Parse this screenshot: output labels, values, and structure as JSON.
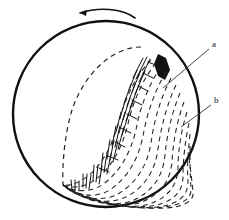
{
  "figure": {
    "kind": "technical-line-drawing",
    "background_color": "#ffffff",
    "ink_color": "#111111",
    "canvas": {
      "width": 229,
      "height": 220
    }
  },
  "sphere": {
    "name": "sphere-outline",
    "center_x": 106,
    "center_y": 114,
    "radius": 93,
    "stroke_width": 2.4,
    "stroke_color": "#111111",
    "fill": "none"
  },
  "rotation_arrow": {
    "name": "rotation-arrow",
    "direction": "counterclockwise-left",
    "stroke_width": 1.6,
    "stroke_color": "#111111",
    "path": "M 135 18 C 122 8, 98 7, 80 13",
    "head": "M 80 13 L 87 10 L 86 16 Z"
  },
  "terminator": {
    "name": "terminator-dashed-curve",
    "stroke_width": 1.2,
    "dash": "5 4",
    "stroke_color": "#222222",
    "path": "M 141 47 C 112 47, 84 74, 72 110 C 65 133, 62 163, 63 185"
  },
  "vertex": {
    "name": "arc-convergence-vertex",
    "x": 63,
    "y": 185
  },
  "arc_family": {
    "name": "nested-dashed-arcs",
    "description": "family of nested dashed arcs fanning from the vertex toward the lower-right limb of the sphere",
    "count": 13,
    "stroke_width": 1.05,
    "dash": "5 4",
    "stroke_color": "#222222",
    "paths": [
      "M 151 60 C 137 74, 126 96, 120 118 C 113 143, 104 163, 88 176 C 79 183, 70 186, 63 185",
      "M 156 63 C 143 79, 133 101, 128 124 C 122 148, 112 167, 95 180 C 85 187, 73 189, 63 185",
      "M 161 67 C 149 84, 140 107, 136 130 C 130 154, 120 172, 102 185 C 91 192, 75 193, 63 185",
      "M 166 72 C 155 90, 147 113, 143 136 C 138 160, 128 177, 110 190 C 97 198, 78 197, 63 185",
      "M 171 78 C 161 97, 154 120, 151 143 C 147 166, 137 182, 118 194 C 103 202, 80 200, 63 185",
      "M 176 85 C 167 104, 161 127, 158 149 C 155 171, 145 187, 126 197 C 110 205, 83 202, 63 185",
      "M 180 93 C 172 112, 167 134, 165 155 C 163 176, 153 191, 134 200 C 116 208, 85 203, 63 185",
      "M 184 102 C 177 121, 173 142, 172 162 C 170 181, 161 194, 142 202 C 123 209, 88 204, 63 185",
      "M 187 112 C 181 131, 178 151, 178 169 C 177 186, 168 197, 150 204 C 129 210, 90 205, 63 185",
      "M 189 123 C 185 142, 183 160, 183 176 C 183 191, 175 200, 157 205 C 135 210, 92 205, 63 185",
      "M 190 134 C 188 152, 187 168, 188 182 C 188 194, 181 202, 164 206 C 141 211, 94 206, 63 185",
      "M 190 146 C 190 162, 190 176, 191 187 C 192 197, 186 203, 170 206 C 146 211, 95 206, 63 185",
      "M 189 158 C 191 172, 192 183, 193 191 C 194 199, 189 204, 175 207 C 151 211, 96 206, 63 185"
    ]
  },
  "hatch_region": {
    "name": "dense-hatch-shading",
    "description": "dense short hatch strokes forming the dark textured band between the terminator and the first arcs",
    "stroke_width": 1.0,
    "stroke_color": "#111111",
    "strokes": [
      "M 143 58 L 133 78",
      "M 147 57 L 136 79",
      "M 150 59 L 139 82",
      "M 137 70 L 129 90",
      "M 141 70 L 132 92",
      "M 145 71 L 135 94",
      "M 131 84 L 124 104",
      "M 135 84 L 127 106",
      "M 139 85 L 130 108",
      "M 126 98 L 120 118",
      "M 130 98 L 123 120",
      "M 134 99 L 126 121",
      "M 121 112 L 116 132",
      "M 125 112 L 119 133",
      "M 129 113 L 122 135",
      "M 116 126 L 112 146",
      "M 120 126 L 115 147",
      "M 124 127 L 118 149",
      "M 110 140 L 107 159",
      "M 114 140 L 110 160",
      "M 118 141 L 113 162",
      "M 103 153 L 101 171",
      "M 107 153 L 104 172",
      "M 111 154 L 107 174",
      "M 94 165 L 93 181",
      "M 98 165 L 96 182",
      "M 102 166 L 99 184",
      "M 83 174 L 83 187",
      "M 87 174 L 86 188",
      "M 91 175 L 89 189",
      "M 71 180 L 72 190",
      "M 75 180 L 75 191",
      "M 79 181 L 79 191",
      "M 148 62 L 158 66",
      "M 143 73 L 153 78",
      "M 138 86 L 148 91",
      "M 132 100 L 142 105",
      "M 127 114 L 137 119",
      "M 121 128 L 131 133",
      "M 115 142 L 125 147",
      "M 108 156 L 118 160",
      "M 99 168 L 109 172"
    ]
  },
  "dark_blob": {
    "name": "dark-filled-patch",
    "description": "solid dark patch near the upper end of the hatched band where label a points",
    "fill": "#111111",
    "path": "M 158 54 L 166 58 L 170 70 L 165 80 L 158 76 L 154 64 Z"
  },
  "labels": [
    {
      "id": "a",
      "name": "label-a",
      "text": "a",
      "x": 212,
      "y": 47,
      "leader": {
        "name": "leader-line-a",
        "path": "M 209 49 L 163 88",
        "stroke_width": 0.9,
        "stroke_color": "#333333"
      }
    },
    {
      "id": "b",
      "name": "label-b",
      "text": "b",
      "x": 214,
      "y": 103,
      "leader": {
        "name": "leader-line-b",
        "path": "M 211 105 L 181 127",
        "stroke_width": 0.9,
        "stroke_color": "#333333"
      }
    }
  ]
}
